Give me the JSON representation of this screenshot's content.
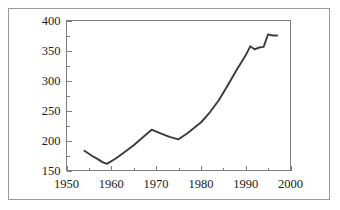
{
  "chart_data": {
    "type": "line",
    "title": "",
    "subtitle": "",
    "xlabel": "",
    "ylabel": "",
    "xlim": [
      1950,
      2000
    ],
    "ylim": [
      150,
      400
    ],
    "grid": false,
    "legend": null,
    "x_ticks": [
      1950,
      1960,
      1970,
      1980,
      1990,
      2000
    ],
    "x_tick_labels": [
      "1950",
      "1960",
      "1970",
      "1980",
      "1990",
      "2000"
    ],
    "x_minor_tick_interval": 5,
    "y_ticks": [
      150,
      200,
      250,
      300,
      350,
      400
    ],
    "y_tick_labels": [
      "150",
      "200",
      "250",
      "300",
      "350",
      "400"
    ],
    "y_minor_tick_interval": 25,
    "line_color": "#3b3b3b",
    "axis_color": "#7d7d7d",
    "frame_color": "#9a9a9a",
    "background_color": "#ffffff",
    "series": [
      {
        "name": "series-1",
        "x": [
          1954,
          1955,
          1956,
          1957,
          1958,
          1959,
          1961,
          1963,
          1965,
          1967,
          1969,
          1971,
          1973,
          1975,
          1977,
          1979,
          1980,
          1982,
          1984,
          1986,
          1987,
          1988,
          1989,
          1990,
          1991,
          1992,
          1993,
          1994,
          1995,
          1996,
          1997
        ],
        "y": [
          183,
          178,
          173,
          169,
          164,
          161,
          170,
          181,
          192,
          205,
          218,
          212,
          206,
          202,
          212,
          224,
          230,
          247,
          267,
          292,
          305,
          318,
          330,
          342,
          357,
          352,
          355,
          356,
          377,
          375,
          375
        ]
      }
    ]
  }
}
